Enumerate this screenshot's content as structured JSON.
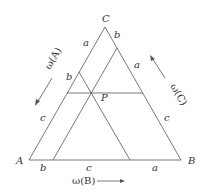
{
  "diagram": {
    "type": "ternary-phase-diagram",
    "vertices": {
      "A": "A",
      "B": "B",
      "C": "C"
    },
    "point_label": "P",
    "segment_labels": {
      "left_side": [
        "a",
        "b",
        "c"
      ],
      "right_side": [
        "b",
        "a",
        "c"
      ],
      "bottom_side": [
        "b",
        "c",
        "a"
      ]
    },
    "axis_labels": {
      "left": "ω(A)",
      "right": "ω(C)",
      "bottom": "ω(B)"
    },
    "colors": {
      "line": "#555555",
      "text": "#333333"
    }
  }
}
